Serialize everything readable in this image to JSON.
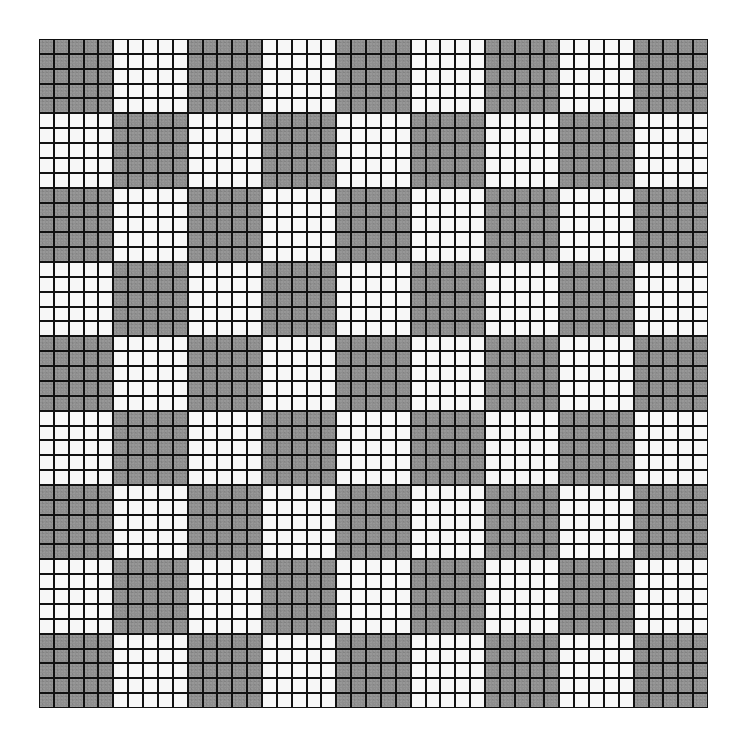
{
  "figure": {
    "type": "checkerboard-grid",
    "block_rows": 9,
    "block_cols": 9,
    "cells_per_block": 5,
    "total_rows": 45,
    "total_cols": 45,
    "pattern_rule": "block (r,c) is dark when (r + c) is even",
    "block_pattern": [
      [
        1,
        0,
        1,
        0,
        1,
        0,
        1,
        0,
        1
      ],
      [
        0,
        1,
        0,
        1,
        0,
        1,
        0,
        1,
        0
      ],
      [
        1,
        0,
        1,
        0,
        1,
        0,
        1,
        0,
        1
      ],
      [
        0,
        1,
        0,
        1,
        0,
        1,
        0,
        1,
        0
      ],
      [
        1,
        0,
        1,
        0,
        1,
        0,
        1,
        0,
        1
      ],
      [
        0,
        1,
        0,
        1,
        0,
        1,
        0,
        1,
        0
      ],
      [
        1,
        0,
        1,
        0,
        1,
        0,
        1,
        0,
        1
      ],
      [
        0,
        1,
        0,
        1,
        0,
        1,
        0,
        1,
        0
      ],
      [
        1,
        0,
        1,
        0,
        1,
        0,
        1,
        0,
        1
      ]
    ],
    "colors": {
      "dark_cell": "#8e8e8e",
      "light_cell": "#f7f7f7",
      "grid_line": "#111111",
      "background": "#ffffff"
    }
  }
}
